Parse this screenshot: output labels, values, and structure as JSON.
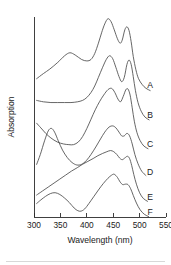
{
  "figure": {
    "background_color": "#ffffff",
    "line_color": "#4a4a4a",
    "axis_color": "#2b2b2b"
  },
  "chart_data": {
    "type": "line",
    "title": "",
    "subtitle": "",
    "xlabel": "Wavelength (nm)",
    "ylabel": "Absorption",
    "xlim": [
      300,
      550
    ],
    "ylim": [
      0,
      1
    ],
    "grid": false,
    "legend_position": "right-inline-curve-end-labels",
    "x_ticks": [
      300,
      350,
      400,
      450,
      500,
      550
    ],
    "x_tick_labels": [
      "300",
      "350",
      "400",
      "450",
      "500",
      "550"
    ],
    "y_ticks": [],
    "y_tick_labels": [],
    "note": "Six vertically offset absorption spectra, curves labelled A-F from top to bottom; y-axis is arbitrary absorption units with no tick marks.",
    "series": [
      {
        "name": "A",
        "label": "A",
        "offset_label": "top",
        "peaks_nm": [
          370,
          440,
          472
        ],
        "peak_note": "broad shoulder near 370 nm, main maximum 440 nm, secondary maximum 472 nm",
        "x": [
          305,
          318,
          330,
          345,
          358,
          368,
          378,
          390,
          400,
          408,
          415,
          422,
          428,
          434,
          440,
          446,
          452,
          458,
          463,
          467,
          472,
          476,
          480,
          484,
          488,
          493,
          498,
          505,
          512,
          520
        ],
        "y": [
          0.18,
          0.25,
          0.31,
          0.4,
          0.49,
          0.53,
          0.5,
          0.44,
          0.42,
          0.44,
          0.52,
          0.66,
          0.8,
          0.92,
          0.99,
          0.95,
          0.84,
          0.72,
          0.66,
          0.7,
          0.84,
          0.88,
          0.83,
          0.68,
          0.48,
          0.3,
          0.18,
          0.1,
          0.05,
          0.02
        ]
      },
      {
        "name": "B",
        "label": "B",
        "offset_label": "second",
        "peaks_nm": [
          445,
          478
        ],
        "peak_note": "flat low region below 400 nm, rising to main maximum 445 nm and sharp band at 478 nm",
        "x": [
          305,
          318,
          332,
          345,
          358,
          370,
          382,
          392,
          400,
          408,
          415,
          422,
          430,
          437,
          443,
          449,
          455,
          461,
          466,
          471,
          476,
          480,
          484,
          488,
          492,
          497,
          503,
          510,
          518
        ],
        "y": [
          0.3,
          0.28,
          0.27,
          0.27,
          0.27,
          0.27,
          0.28,
          0.3,
          0.34,
          0.41,
          0.5,
          0.62,
          0.76,
          0.87,
          0.92,
          0.88,
          0.76,
          0.63,
          0.56,
          0.62,
          0.8,
          0.86,
          0.8,
          0.63,
          0.44,
          0.27,
          0.15,
          0.07,
          0.03
        ]
      },
      {
        "name": "C",
        "label": "C",
        "offset_label": "third",
        "peaks_nm": [
          450,
          478
        ],
        "peak_note": "broad minimum near 375 nm, steep rise, twin maxima 450 and 478 nm",
        "x": [
          305,
          313,
          322,
          332,
          344,
          356,
          366,
          375,
          384,
          392,
          400,
          408,
          416,
          424,
          432,
          440,
          447,
          453,
          459,
          464,
          469,
          474,
          478,
          482,
          486,
          490,
          495,
          501,
          508,
          516
        ],
        "y": [
          0.4,
          0.33,
          0.25,
          0.18,
          0.12,
          0.09,
          0.08,
          0.08,
          0.12,
          0.2,
          0.32,
          0.46,
          0.6,
          0.72,
          0.82,
          0.9,
          0.92,
          0.86,
          0.76,
          0.72,
          0.8,
          0.9,
          0.91,
          0.82,
          0.63,
          0.43,
          0.26,
          0.14,
          0.06,
          0.02
        ]
      },
      {
        "name": "D",
        "label": "D",
        "offset_label": "fourth",
        "peaks_nm": [
          333,
          452,
          477
        ],
        "peak_note": "sharp band at 333 nm, minimum near 383 nm, broad maximum 452 nm with shoulder 477 nm",
        "x": [
          305,
          312,
          320,
          327,
          333,
          339,
          346,
          354,
          363,
          372,
          381,
          390,
          399,
          408,
          417,
          426,
          434,
          442,
          449,
          455,
          461,
          466,
          471,
          476,
          481,
          486,
          491,
          497,
          504,
          512
        ],
        "y": [
          0.22,
          0.38,
          0.6,
          0.76,
          0.8,
          0.74,
          0.6,
          0.45,
          0.33,
          0.25,
          0.21,
          0.22,
          0.28,
          0.38,
          0.5,
          0.63,
          0.74,
          0.82,
          0.84,
          0.81,
          0.74,
          0.68,
          0.68,
          0.72,
          0.68,
          0.55,
          0.38,
          0.23,
          0.11,
          0.04
        ]
      },
      {
        "name": "E",
        "label": "E",
        "offset_label": "fifth",
        "peaks_nm": [
          455,
          480
        ],
        "peak_note": "monotonic rise from 305 nm crossing curve D near 372 nm, maximum 455 nm, shoulder 480 nm",
        "x": [
          305,
          316,
          327,
          338,
          349,
          360,
          371,
          382,
          392,
          402,
          412,
          421,
          430,
          438,
          445,
          451,
          457,
          462,
          467,
          472,
          477,
          481,
          485,
          489,
          494,
          500,
          507,
          515
        ],
        "y": [
          0.14,
          0.21,
          0.28,
          0.35,
          0.42,
          0.49,
          0.56,
          0.62,
          0.68,
          0.73,
          0.78,
          0.83,
          0.87,
          0.9,
          0.92,
          0.9,
          0.85,
          0.79,
          0.76,
          0.79,
          0.82,
          0.78,
          0.66,
          0.5,
          0.33,
          0.18,
          0.08,
          0.03
        ]
      },
      {
        "name": "F",
        "label": "F",
        "offset_label": "bottom",
        "peaks_nm": [
          340,
          450,
          472
        ],
        "peak_note": "band at 340 nm, deep minimum 385 nm, strongest maximum 450 nm, shoulder 472 nm, tail to 515 nm",
        "x": [
          305,
          313,
          322,
          331,
          340,
          349,
          358,
          367,
          376,
          383,
          389,
          396,
          404,
          413,
          422,
          431,
          440,
          447,
          452,
          458,
          463,
          468,
          473,
          478,
          483,
          488,
          494,
          501,
          509,
          517
        ],
        "y": [
          0.3,
          0.38,
          0.46,
          0.52,
          0.54,
          0.5,
          0.42,
          0.32,
          0.2,
          0.14,
          0.13,
          0.18,
          0.3,
          0.45,
          0.6,
          0.74,
          0.86,
          0.93,
          0.95,
          0.88,
          0.78,
          0.72,
          0.73,
          0.72,
          0.63,
          0.48,
          0.31,
          0.16,
          0.06,
          0.01
        ]
      }
    ]
  }
}
